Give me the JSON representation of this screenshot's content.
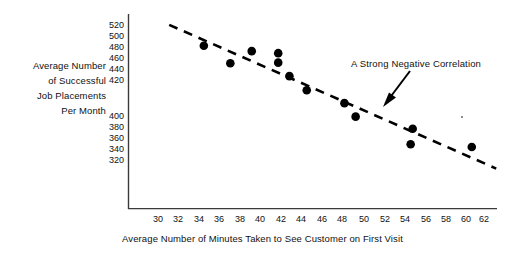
{
  "chart_data": {
    "type": "scatter",
    "title": "",
    "xlabel": "Average Number of Minutes Taken to See Customer on First Visit",
    "ylabel": "Average Number of Successful Job Placements Per Month",
    "ylabel_lines": [
      "Average Number",
      "of Successful",
      "Job Placements",
      "Per Month"
    ],
    "xticks": [
      30,
      32,
      34,
      36,
      38,
      40,
      42,
      44,
      46,
      48,
      50,
      52,
      54,
      56,
      58,
      60,
      62
    ],
    "yticks": [
      520,
      500,
      480,
      460,
      440,
      420,
      400,
      380,
      360,
      340,
      320
    ],
    "xlim": [
      29,
      63
    ],
    "ylim": [
      300,
      528
    ],
    "grid": false,
    "legend": null,
    "marker_color": "#000000",
    "axis_color": "#3a3a3a",
    "points": [
      {
        "x": 34.5,
        "y": 490
      },
      {
        "x": 37.1,
        "y": 464
      },
      {
        "x": 39.2,
        "y": 482
      },
      {
        "x": 41.8,
        "y": 479
      },
      {
        "x": 41.8,
        "y": 465
      },
      {
        "x": 42.9,
        "y": 445
      },
      {
        "x": 44.6,
        "y": 424
      },
      {
        "x": 48.3,
        "y": 405
      },
      {
        "x": 49.4,
        "y": 385
      },
      {
        "x": 55.0,
        "y": 367
      },
      {
        "x": 54.8,
        "y": 344
      },
      {
        "x": 60.8,
        "y": 340
      }
    ],
    "trendline": {
      "style": "dashed",
      "description": "A Strong Negative Correlation",
      "x_start": 31.1,
      "y_start": 521,
      "x_end": 63.2,
      "y_end": 308
    },
    "annotations": [
      {
        "text": "A  Strong Negative  Correlation",
        "arrow_from_x": 42.9,
        "arrow_from_y": 453,
        "arrow_to_x": 52.4,
        "arrow_to_y": 398
      }
    ]
  },
  "annotation_text": "A  Strong Negative  Correlation"
}
